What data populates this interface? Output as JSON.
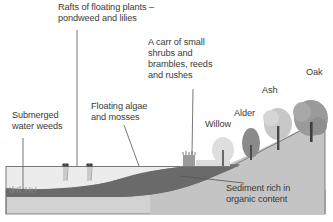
{
  "diagram": {
    "labels": {
      "rafts": [
        "Rafts of floating plants –",
        "pondweed and lilies"
      ],
      "carr": [
        "A carr of small",
        "shrubs and",
        "brambles, reeds",
        "and rushes"
      ],
      "submerged": [
        "Submerged",
        "water weeds"
      ],
      "algae": [
        "Floating algae",
        "and mosses"
      ],
      "sediment": [
        "Sediment rich in",
        "organic content"
      ],
      "willow": "Willow",
      "alder": "Alder",
      "ash": "Ash",
      "oak": "Oak"
    },
    "colors": {
      "water": "#ececec",
      "sediment_dark": "#6e6e6e",
      "ground": "#c4c4c4",
      "bed": "#d2d2d2",
      "outline": "#707070",
      "text": "#3a3a3a",
      "willow": "#dedede",
      "alder": "#8a8a8a",
      "ash": "#c8c8c8",
      "oak": "#9a9a9a"
    }
  }
}
